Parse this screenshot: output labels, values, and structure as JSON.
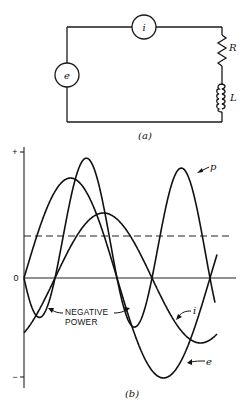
{
  "circuit": {
    "caption": "(a)",
    "source_label": "e",
    "ammeter_label": "i",
    "resistor_label": "R",
    "inductor_label": "L"
  },
  "graph": {
    "caption": "(b)",
    "y_plus_label": "+",
    "y_zero_label": "0",
    "y_minus_label": "−",
    "annotation_line1": "NEGATIVE",
    "annotation_line2": "POWER",
    "p_label": "p",
    "i_label": "i",
    "e_label": "e"
  },
  "chart_data": {
    "type": "line",
    "xlabel": "",
    "ylabel": "",
    "y_ticks": [
      "+",
      "0",
      "−"
    ],
    "grid": false,
    "legend": "inline labels (p, i, e)",
    "series": [
      {
        "name": "e",
        "description": "voltage",
        "shape": "sine",
        "amplitude": 1.0,
        "phase_deg": 0,
        "cycles_shown": 1.05
      },
      {
        "name": "i",
        "description": "current (lags e)",
        "shape": "sine",
        "amplitude": 0.65,
        "phase_deg": -60,
        "cycles_shown": 1.0
      },
      {
        "name": "p",
        "description": "instantaneous power = e·i",
        "shape": "double-frequency",
        "peak": 1.25,
        "min": -0.4,
        "average": 0.42
      }
    ],
    "reference_lines": [
      {
        "name": "average power",
        "style": "dashed",
        "value": 0.42
      }
    ],
    "annotations": [
      "NEGATIVE POWER (regions where p < 0)"
    ],
    "geometry_px": {
      "x0": 24,
      "x_end": 217,
      "y_zero": 278,
      "e": {
        "zero": 24,
        "half_period": 93,
        "amp": 100
      },
      "i": {
        "zero": 55,
        "half_period": 97,
        "amp": 65
      },
      "p_scale": 164,
      "avg_y": 236
    }
  }
}
